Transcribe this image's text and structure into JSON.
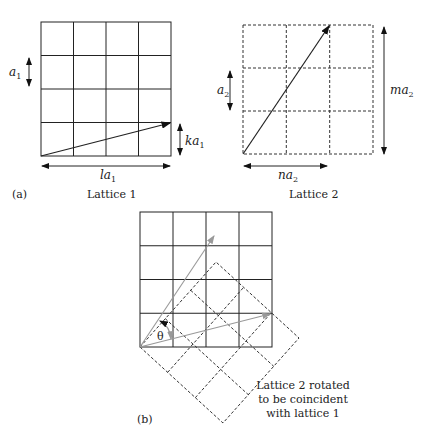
{
  "panel_a": {
    "tag": "(a)",
    "lattice1": {
      "caption": "Lattice 1",
      "a_label": "a",
      "a_sub": "1",
      "ka_label": "ka",
      "ka_sub": "1",
      "la_label": "la",
      "la_sub": "1"
    },
    "lattice2": {
      "caption": "Lattice 2",
      "a_label": "a",
      "a_sub": "2",
      "ma_label": "ma",
      "ma_sub": "2",
      "na_label": "na",
      "na_sub": "2"
    }
  },
  "panel_b": {
    "tag": "(b)",
    "theta": "θ",
    "note_lines": [
      "Lattice 2 rotated",
      "to be coincident",
      "with lattice 1"
    ]
  }
}
